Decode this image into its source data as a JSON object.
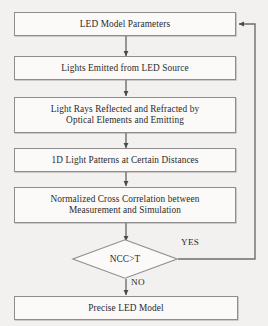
{
  "diagram": {
    "background_color": "#f2f1ef",
    "line_color": "#8d8d8d",
    "text_color": "#2b2b2b",
    "nodes": [
      {
        "id": "led-model-parameters",
        "shape": "process",
        "label": "LED Model Parameters"
      },
      {
        "id": "lights-emitted",
        "shape": "process",
        "label": "Lights Emitted from LED Source"
      },
      {
        "id": "light-rays-reflected",
        "shape": "process",
        "label": "Light Rays Reflected and Refracted by\nOptical Elements and Emitting"
      },
      {
        "id": "light-patterns",
        "shape": "process",
        "label": "1D Light Patterns at Certain Distances"
      },
      {
        "id": "normalized-cross-correlation",
        "shape": "process",
        "label": "Normalized Cross Correlation between\nMeasurement and Simulation"
      },
      {
        "id": "ncc-threshold-decision",
        "shape": "decision",
        "label": "NCC>T"
      },
      {
        "id": "precise-led-model",
        "shape": "process",
        "label": "Precise LED Model"
      }
    ],
    "edge_labels": {
      "yes": "YES",
      "no": "NO"
    }
  }
}
